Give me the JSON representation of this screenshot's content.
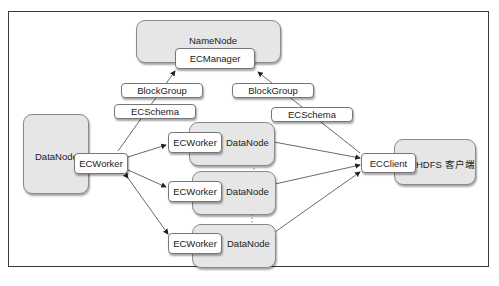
{
  "diagram": {
    "namenode": {
      "label": "NameNode",
      "component": "ECManager"
    },
    "left_datanode": {
      "label": "DataNode",
      "component": "ECWorker"
    },
    "client": {
      "label": "HDFS 客户端",
      "component": "ECClient"
    },
    "middle_datanodes": [
      {
        "label": "DataNode",
        "component": "ECWorker"
      },
      {
        "label": "DataNode",
        "component": "ECWorker"
      },
      {
        "label": "DataNode",
        "component": "ECWorker"
      }
    ],
    "left_messages": [
      "BlockGroup",
      "ECSchema"
    ],
    "right_messages": [
      "BlockGroup",
      "ECSchema"
    ],
    "colors": {
      "node_fill": "#e6e6e6",
      "box_fill": "#ffffff",
      "line": "#333333"
    }
  }
}
